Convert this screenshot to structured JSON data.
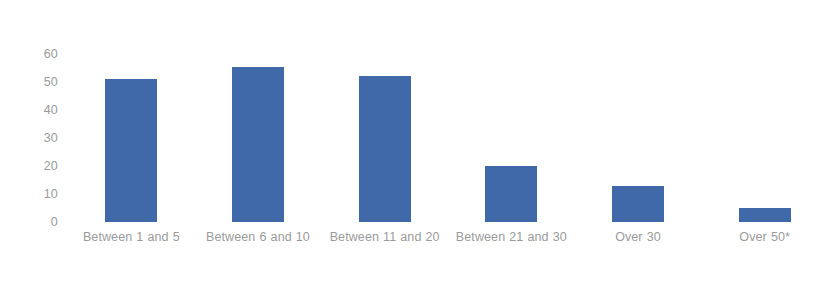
{
  "chart_data": {
    "type": "bar",
    "title": "",
    "subtitle": "",
    "xlabel": "",
    "ylabel": "",
    "categories": [
      "Between 1 and 5",
      "Between 6 and 10",
      "Between 11 and 20",
      "Between 21 and 30",
      "Over 30",
      "Over 50*"
    ],
    "values": [
      51,
      55.5,
      52,
      20,
      13,
      5
    ],
    "ylim": [
      0,
      60
    ],
    "yticks": [
      0,
      10,
      20,
      30,
      40,
      50,
      60
    ],
    "ytick_labels": [
      "0",
      "10",
      "20",
      "30",
      "40",
      "50",
      "60"
    ],
    "grid": false,
    "legend": false,
    "legend_position": "none",
    "bar_color": "#3f69a8",
    "text_color": "#9b9b9b",
    "background_color": "#ffffff",
    "annotations": [
      "* denotes the 'Over 50' category is marked with an asterisk"
    ]
  }
}
